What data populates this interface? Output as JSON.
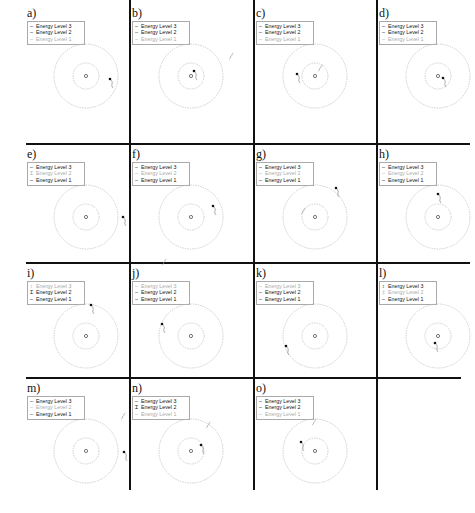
{
  "figure": {
    "legend_entries": [
      "Energy Level 3",
      "Energy Level 2",
      "Energy Level 1"
    ],
    "colors": {
      "active": "#111111",
      "inactive": "#aaaaaa",
      "orbit": "#bbbbbb",
      "grid": "#111111"
    },
    "panels": [
      {
        "label": "a)",
        "active": [
          true,
          true,
          false
        ],
        "marks": [
          "–",
          "–",
          "–"
        ],
        "electron": [
          84,
          75
        ],
        "photon": null
      },
      {
        "label": "b)",
        "active": [
          true,
          true,
          false
        ],
        "marks": [
          "–",
          "–",
          "–"
        ],
        "electron": [
          63,
          67
        ],
        "photon": [
          101,
          52
        ]
      },
      {
        "label": "c)",
        "active": [
          true,
          true,
          false
        ],
        "marks": [
          "–",
          "–",
          "–"
        ],
        "electron": [
          42,
          70
        ],
        "photon": [
          66,
          64
        ]
      },
      {
        "label": "d)",
        "active": [
          true,
          true,
          false
        ],
        "marks": [
          "–",
          "–",
          "–"
        ],
        "electron": [
          65,
          74
        ],
        "photon": null
      },
      {
        "label": "e)",
        "active": [
          true,
          false,
          true
        ],
        "marks": [
          "–",
          "Ɪ",
          "–"
        ],
        "electron": [
          97,
          72
        ],
        "photon": null
      },
      {
        "label": "f)",
        "active": [
          true,
          false,
          true
        ],
        "marks": [
          "–",
          "–",
          "–"
        ],
        "electron": [
          82,
          61
        ],
        "photon": [
          34,
          117
        ]
      },
      {
        "label": "g)",
        "active": [
          true,
          false,
          true
        ],
        "marks": [
          "–",
          "–",
          "–"
        ],
        "electron": [
          81,
          43
        ],
        "photon": [
          49,
          66
        ]
      },
      {
        "label": "h)",
        "active": [
          true,
          false,
          true
        ],
        "marks": [
          "–",
          "–",
          "–"
        ],
        "electron": [
          60,
          49
        ],
        "photon": null
      },
      {
        "label": "i)",
        "active": [
          false,
          true,
          true
        ],
        "marks": [
          "↕",
          "Ɪ",
          "–"
        ],
        "electron": [
          65,
          41
        ],
        "photon": null
      },
      {
        "label": "j)",
        "active": [
          false,
          true,
          true
        ],
        "marks": [
          "–",
          "–",
          "–"
        ],
        "electron": [
          31,
          60
        ],
        "photon": null
      },
      {
        "label": "k)",
        "active": [
          false,
          true,
          true
        ],
        "marks": [
          "–",
          "–",
          "–"
        ],
        "electron": [
          31,
          82
        ],
        "photon": null
      },
      {
        "label": "l)",
        "active": [
          true,
          false,
          true
        ],
        "marks": [
          "↕",
          "‡",
          "–"
        ],
        "electron": [
          57,
          79
        ],
        "photon": null
      },
      {
        "label": "m)",
        "active": [
          true,
          false,
          true
        ],
        "marks": [
          "–",
          "–",
          "–"
        ],
        "electron": [
          98,
          73
        ],
        "photon": [
          98,
          37
        ]
      },
      {
        "label": "n)",
        "active": [
          true,
          true,
          false
        ],
        "marks": [
          "–",
          "Ɪ",
          "–"
        ],
        "electron": [
          70,
          66
        ],
        "photon": [
          78,
          46
        ]
      },
      {
        "label": "o)",
        "active": [
          true,
          true,
          false
        ],
        "marks": [
          "–",
          "–",
          "–"
        ],
        "electron": [
          46,
          63
        ],
        "photon": [
          60,
          43
        ]
      }
    ]
  }
}
